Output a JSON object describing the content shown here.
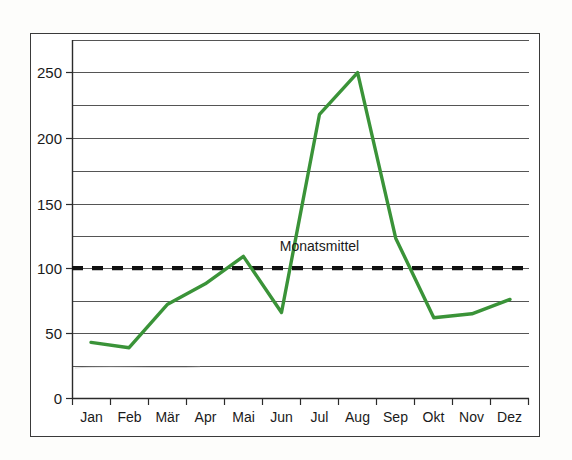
{
  "figure": {
    "frame_color": "#3a3a3a",
    "background": "#ffffff"
  },
  "chart_data": {
    "type": "line",
    "title": "",
    "xlabel": "",
    "ylabel": "",
    "categories": [
      "Jan",
      "Feb",
      "Mär",
      "Apr",
      "Mai",
      "Jun",
      "Jul",
      "Aug",
      "Sep",
      "Okt",
      "Nov",
      "Dez"
    ],
    "series": [
      {
        "name": "Monatswerte",
        "color": "#3a9338",
        "values": [
          43,
          39,
          72,
          88,
          109,
          66,
          218,
          250,
          123,
          62,
          65,
          76
        ]
      }
    ],
    "reference_lines": [
      {
        "name": "Monatsmittel",
        "label": "Monatsmittel",
        "value": 100,
        "style": "dashed",
        "color": "#111111"
      }
    ],
    "ylim": [
      0,
      275
    ],
    "xlim": [
      0,
      12
    ],
    "y_ticks_major": [
      0,
      50,
      100,
      150,
      200,
      250
    ],
    "y_ticks_minor": [
      25,
      75,
      125,
      175,
      225,
      275
    ],
    "y_tick_labels": [
      "0",
      "50",
      "100",
      "150",
      "200",
      "250"
    ],
    "gridlines": "horizontal",
    "grid_interval": 25,
    "legend": "none",
    "annotations": [
      {
        "text": "Monatsmittel",
        "x_category": "Jul",
        "y": 112
      }
    ]
  },
  "axes": {
    "y_labels": [
      "250",
      "200",
      "150",
      "100",
      "50",
      "0"
    ],
    "x_labels": [
      "Jan",
      "Feb",
      "Mär",
      "Apr",
      "Mai",
      "Jun",
      "Jul",
      "Aug",
      "Sep",
      "Okt",
      "Nov",
      "Dez"
    ]
  },
  "annotation": {
    "mean_label": "Monatsmittel"
  }
}
